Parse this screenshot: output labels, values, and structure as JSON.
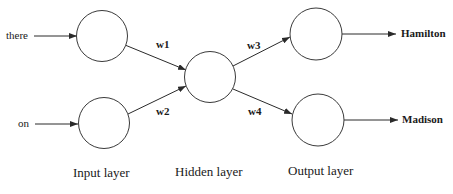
{
  "diagram": {
    "type": "neural-network",
    "inputs": [
      {
        "label": "there"
      },
      {
        "label": "on"
      }
    ],
    "outputs": [
      {
        "label": "Hamilton"
      },
      {
        "label": "Madison"
      }
    ],
    "weights": [
      {
        "label": "w1"
      },
      {
        "label": "w2"
      },
      {
        "label": "w3"
      },
      {
        "label": "w4"
      }
    ],
    "layers": [
      {
        "label": "Input layer"
      },
      {
        "label": "Hidden layer"
      },
      {
        "label": "Output layer"
      }
    ],
    "nodes": {
      "input": 2,
      "hidden": 1,
      "output": 2
    },
    "colors": {
      "stroke": "#2a2a2a",
      "background": "#ffffff",
      "text": "#1a1a1a"
    }
  }
}
